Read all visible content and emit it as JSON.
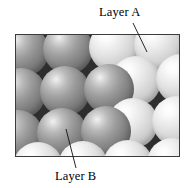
{
  "figure": {
    "kind": "close-packed-spheres-diagram",
    "labels": {
      "layer_a": "Layer A",
      "layer_b": "Layer B"
    },
    "frame": {
      "x": 15,
      "y": 34,
      "width": 165,
      "height": 123,
      "border_color": "#3b3b3b",
      "interstice_color": "#2e2e2e"
    },
    "leader_lines": [
      {
        "name": "layer-a-leader",
        "x1": 133,
        "y1": 23,
        "x2": 147,
        "y2": 52
      },
      {
        "name": "layer-b-leader",
        "x1": 76,
        "y1": 168,
        "x2": 66,
        "y2": 129
      }
    ],
    "layers": [
      {
        "id": "A",
        "label": "Layer A",
        "tone": "light",
        "color": "#e2e2e2",
        "highlight": "#ffffff"
      },
      {
        "id": "B",
        "label": "Layer B",
        "tone": "dark",
        "color": "#868686",
        "highlight": "#f2f2f2"
      }
    ],
    "spheres": [
      {
        "layer": "B",
        "cx": 8,
        "cy": 16,
        "r": 25
      },
      {
        "layer": "B",
        "cx": 52,
        "cy": 14,
        "r": 25
      },
      {
        "layer": "A",
        "cx": 98,
        "cy": 12,
        "r": 25
      },
      {
        "layer": "A",
        "cx": 143,
        "cy": 10,
        "r": 25
      },
      {
        "layer": "A",
        "cx": 120,
        "cy": 46,
        "r": 25
      },
      {
        "layer": "A",
        "cx": 165,
        "cy": 44,
        "r": 25
      },
      {
        "layer": "B",
        "cx": 5,
        "cy": 58,
        "r": 25
      },
      {
        "layer": "B",
        "cx": 49,
        "cy": 56,
        "r": 25
      },
      {
        "layer": "B",
        "cx": 93,
        "cy": 54,
        "r": 25
      },
      {
        "layer": "A",
        "cx": 117,
        "cy": 88,
        "r": 25
      },
      {
        "layer": "A",
        "cx": 161,
        "cy": 86,
        "r": 25
      },
      {
        "layer": "B",
        "cx": 2,
        "cy": 100,
        "r": 25
      },
      {
        "layer": "B",
        "cx": 46,
        "cy": 98,
        "r": 25
      },
      {
        "layer": "B",
        "cx": 90,
        "cy": 96,
        "r": 25
      },
      {
        "layer": "A",
        "cx": 22,
        "cy": 132,
        "r": 25
      },
      {
        "layer": "A",
        "cx": 67,
        "cy": 131,
        "r": 25
      },
      {
        "layer": "A",
        "cx": 112,
        "cy": 130,
        "r": 25
      },
      {
        "layer": "A",
        "cx": 156,
        "cy": 128,
        "r": 25
      }
    ]
  }
}
